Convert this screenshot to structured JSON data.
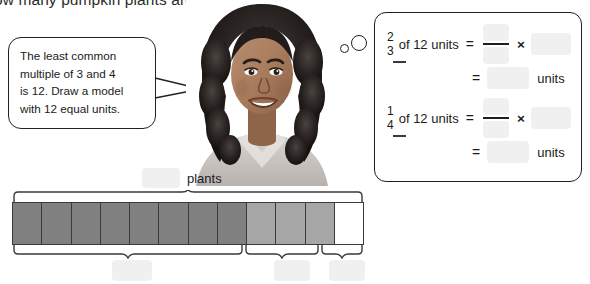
{
  "header": {
    "question": "ow many pumpkin plants are in the garden?"
  },
  "speech_bubble": {
    "line1": "The least common",
    "line2": "multiple of 3 and 4",
    "line3": "is 12. Draw a model",
    "line4": "with 12 equal units."
  },
  "thought_dots": {
    "small": "small-circle",
    "large": "large-circle"
  },
  "photo": {
    "alt": "student-photo"
  },
  "math_panel": {
    "equations": [
      {
        "fraction_numerator": "2",
        "fraction_denominator": "3",
        "of_text": "of 12 units",
        "equals": "=",
        "times": "×",
        "blank_numerator": "",
        "blank_denominator": "",
        "blank_multiplier": "",
        "result_equals": "=",
        "blank_result": "",
        "units_label": "units"
      },
      {
        "fraction_numerator": "1",
        "fraction_denominator": "4",
        "of_text": "of 12 units",
        "equals": "=",
        "times": "×",
        "blank_numerator": "",
        "blank_denominator": "",
        "blank_multiplier": "",
        "result_equals": "=",
        "blank_result": "",
        "units_label": "units"
      }
    ]
  },
  "bar_model": {
    "top_label": "plants",
    "top_blank": "",
    "total_units": 12,
    "cells": [
      "dark",
      "dark",
      "dark",
      "dark",
      "dark",
      "dark",
      "dark",
      "dark",
      "light",
      "light",
      "light",
      "empty"
    ],
    "bottom_blanks": [
      "",
      "",
      ""
    ],
    "colors": {
      "dark": "#808080",
      "light": "#a6a6a6",
      "empty": "#ffffff",
      "outline": "#3a3a3a",
      "blank_fill": "#f0f0f0"
    }
  }
}
